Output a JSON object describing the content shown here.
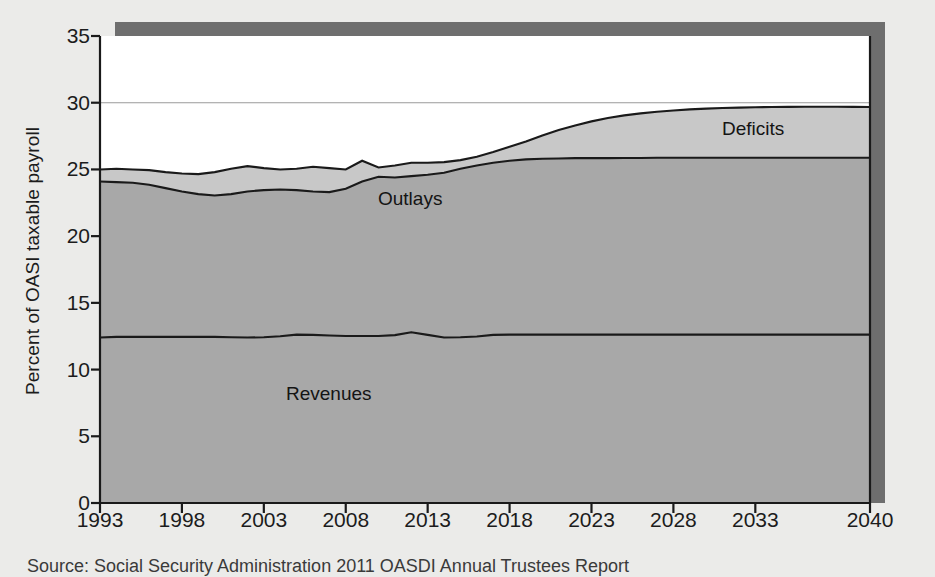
{
  "figure": {
    "source_note": "Source: Social Security Administration 2011 OASDI Annual Trustees Report",
    "labels": {
      "deficits": "Deficits",
      "outlays": "Outlays",
      "revenues": "Revenues"
    }
  },
  "colors": {
    "page_background": "#ebebe9",
    "plot_background": "#ffffff",
    "revenues_fill": "#a8a8a8",
    "outlays_fill": "#a8a8a8",
    "deficits_fill": "#c8c8c8",
    "line_stroke": "#1a1a1a",
    "gridline": "#9a9a9a",
    "shadow": "#6e6e6e",
    "text": "#1c1c1c"
  },
  "chart_data": {
    "type": "area",
    "title": "",
    "subtitle": "",
    "xlabel": "",
    "ylabel": "Percent of OASI taxable payroll",
    "xlim": [
      1993,
      2040
    ],
    "ylim": [
      0,
      35
    ],
    "grid": "horizontal-at-30-only",
    "legend": "inline-labels",
    "ytick_labels": [
      "0",
      "5",
      "10",
      "15",
      "20",
      "25",
      "30",
      "35"
    ],
    "ytick_values": [
      0,
      5,
      10,
      15,
      20,
      25,
      30,
      35
    ],
    "xtick_labels": [
      "1993",
      "1998",
      "2003",
      "2008",
      "2013",
      "2018",
      "2023",
      "2028",
      "2033",
      "2040"
    ],
    "xtick_values": [
      1993,
      1998,
      2003,
      2008,
      2013,
      2018,
      2023,
      2028,
      2033,
      2040
    ],
    "x": [
      1993,
      1994,
      1995,
      1996,
      1997,
      1998,
      1999,
      2000,
      2001,
      2002,
      2003,
      2004,
      2005,
      2006,
      2007,
      2008,
      2009,
      2010,
      2011,
      2012,
      2013,
      2014,
      2015,
      2016,
      2017,
      2018,
      2019,
      2020,
      2021,
      2022,
      2023,
      2024,
      2025,
      2026,
      2027,
      2028,
      2029,
      2030,
      2031,
      2032,
      2033,
      2034,
      2035,
      2036,
      2037,
      2038,
      2039,
      2040
    ],
    "series": [
      {
        "name": "Revenues",
        "note": "lower band boundary, percent of OASI taxable payroll",
        "values": [
          12.4,
          12.45,
          12.45,
          12.45,
          12.45,
          12.45,
          12.45,
          12.45,
          12.42,
          12.4,
          12.42,
          12.5,
          12.62,
          12.6,
          12.55,
          12.52,
          12.52,
          12.52,
          12.58,
          12.8,
          12.6,
          12.4,
          12.42,
          12.48,
          12.6,
          12.62,
          12.62,
          12.62,
          12.62,
          12.62,
          12.62,
          12.62,
          12.62,
          12.62,
          12.62,
          12.62,
          12.62,
          12.62,
          12.62,
          12.62,
          12.62,
          12.62,
          12.62,
          12.62,
          12.62,
          12.62,
          12.62,
          12.62
        ]
      },
      {
        "name": "Outlays",
        "note": "top of the Outlays band (cost rate)",
        "values": [
          24.1,
          24.05,
          24.0,
          23.85,
          23.6,
          23.35,
          23.15,
          23.05,
          23.15,
          23.35,
          23.45,
          23.5,
          23.45,
          23.35,
          23.3,
          23.55,
          24.1,
          24.45,
          24.4,
          24.5,
          24.6,
          24.75,
          25.05,
          25.3,
          25.5,
          25.65,
          25.75,
          25.8,
          25.82,
          25.85,
          25.85,
          25.85,
          25.86,
          25.86,
          25.87,
          25.87,
          25.88,
          25.88,
          25.88,
          25.88,
          25.88,
          25.88,
          25.88,
          25.88,
          25.88,
          25.88,
          25.88,
          25.88
        ]
      },
      {
        "name": "Deficits",
        "note": "top of the Deficits band (total obligations)",
        "values": [
          25.0,
          25.05,
          25.0,
          24.95,
          24.8,
          24.7,
          24.65,
          24.8,
          25.05,
          25.25,
          25.1,
          25.0,
          25.05,
          25.2,
          25.1,
          25.0,
          25.65,
          25.15,
          25.3,
          25.5,
          25.5,
          25.55,
          25.7,
          25.95,
          26.3,
          26.7,
          27.1,
          27.55,
          27.95,
          28.3,
          28.6,
          28.85,
          29.05,
          29.2,
          29.32,
          29.42,
          29.5,
          29.56,
          29.6,
          29.63,
          29.66,
          29.68,
          29.69,
          29.7,
          29.7,
          29.7,
          29.69,
          29.68
        ]
      }
    ]
  }
}
